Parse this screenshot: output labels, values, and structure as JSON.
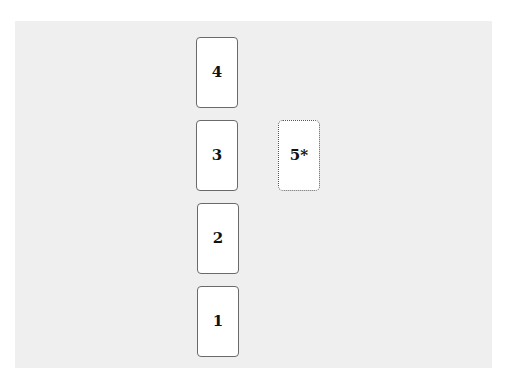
{
  "diagram": {
    "type": "card-spread-layout",
    "background_color": "#efefef",
    "cards": [
      {
        "label": "4",
        "position": "top of column",
        "style": "solid"
      },
      {
        "label": "3",
        "position": "column, second from top",
        "style": "solid"
      },
      {
        "label": "2",
        "position": "column, third from top",
        "style": "solid"
      },
      {
        "label": "1",
        "position": "bottom of column",
        "style": "solid"
      },
      {
        "label": "5*",
        "position": "right of card 3",
        "style": "dotted"
      }
    ]
  }
}
